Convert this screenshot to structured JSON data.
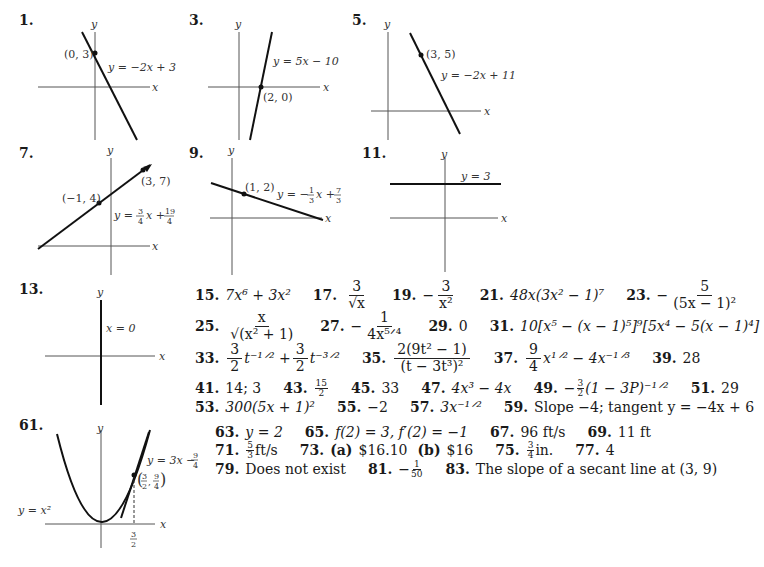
{
  "problems": {
    "p1": {
      "number": "1.",
      "equation": "y = −2x + 3",
      "point": "(0, 3)",
      "axis_x": "x",
      "axis_y": "y"
    },
    "p3": {
      "number": "3.",
      "equation": "y = 5x − 10",
      "point": "(2, 0)",
      "axis_x": "x",
      "axis_y": "y"
    },
    "p5": {
      "number": "5.",
      "equation": "y = −2x + 11",
      "point": "(3, 5)",
      "axis_x": "x",
      "axis_y": "y"
    },
    "p7": {
      "number": "7.",
      "equation_prefix": "y = ",
      "slope_num": "3",
      "slope_den": "4",
      "equation_mid": "x + ",
      "int_num": "19",
      "int_den": "4",
      "point_a": "(−1, 4)",
      "point_b": "(3, 7)",
      "axis_x": "x",
      "axis_y": "y"
    },
    "p9": {
      "number": "9.",
      "equation_prefix": "y = −",
      "slope_num": "1",
      "slope_den": "3",
      "equation_mid": "x + ",
      "int_num": "7",
      "int_den": "3",
      "point": "(1, 2)",
      "axis_x": "x",
      "axis_y": "y"
    },
    "p11": {
      "number": "11.",
      "equation": "y = 3",
      "axis_x": "x",
      "axis_y": "y"
    },
    "p13": {
      "number": "13.",
      "equation": "x = 0",
      "axis_x": "x",
      "axis_y": "y"
    },
    "p61": {
      "number": "61.",
      "curve": "y = x²",
      "tangent_prefix": "y = 3x − ",
      "tangent_num": "9",
      "tangent_den": "4",
      "point_x_num": "3",
      "point_x_den": "2",
      "point_y_num": "9",
      "point_y_den": "4",
      "tick_num": "3",
      "tick_den": "2",
      "axis_x": "x",
      "axis_y": "y"
    }
  },
  "answers": {
    "a15": {
      "n": "15.",
      "text": "7x⁶ + 3x²"
    },
    "a17": {
      "n": "17.",
      "num": "3",
      "den": "√x"
    },
    "a19": {
      "n": "19.",
      "sign": "−",
      "num": "3",
      "den": "x²"
    },
    "a21": {
      "n": "21.",
      "text": "48x(3x² − 1)⁷"
    },
    "a23": {
      "n": "23.",
      "sign": "−",
      "num": "5",
      "den": "(5x − 1)²"
    },
    "a25": {
      "n": "25.",
      "num": "x",
      "den": "√(x² + 1)"
    },
    "a27": {
      "n": "27.",
      "sign": "−",
      "num": "1",
      "den": "4x⁵ᐟ⁴"
    },
    "a29": {
      "n": "29.",
      "text": "0"
    },
    "a31": {
      "n": "31.",
      "text": "10[x⁵ − (x − 1)⁵]⁹[5x⁴ − 5(x − 1)⁴]"
    },
    "a33": {
      "n": "33.",
      "c1_num": "3",
      "c1_den": "2",
      "t1": "t⁻¹ᐟ² + ",
      "c2_num": "3",
      "c2_den": "2",
      "t2": "t⁻³ᐟ²"
    },
    "a35": {
      "n": "35.",
      "num": "2(9t² − 1)",
      "den": "(t − 3t³)²"
    },
    "a37": {
      "n": "37.",
      "c_num": "9",
      "c_den": "4",
      "text": "x¹ᐟ² − 4x⁻¹ᐟ³"
    },
    "a39": {
      "n": "39.",
      "text": "28"
    },
    "a41": {
      "n": "41.",
      "text": "14; 3"
    },
    "a43": {
      "n": "43.",
      "num": "15",
      "den": "2"
    },
    "a45": {
      "n": "45.",
      "text": "33"
    },
    "a47": {
      "n": "47.",
      "text": "4x³ − 4x"
    },
    "a49": {
      "n": "49.",
      "sign": "−",
      "num": "3",
      "den": "2",
      "text": "(1 − 3P)⁻¹ᐟ²"
    },
    "a51": {
      "n": "51.",
      "text": "29"
    },
    "a53": {
      "n": "53.",
      "text": "300(5x + 1)²"
    },
    "a55": {
      "n": "55.",
      "text": "−2"
    },
    "a57": {
      "n": "57.",
      "text": "3x⁻¹ᐟ²"
    },
    "a59": {
      "n": "59.",
      "text": "Slope −4; tangent y = −4x + 6"
    },
    "a63": {
      "n": "63.",
      "text": "y = 2"
    },
    "a65": {
      "n": "65.",
      "text": "f(2) = 3, f′(2) = −1"
    },
    "a67": {
      "n": "67.",
      "text": "96 ft/s"
    },
    "a69": {
      "n": "69.",
      "text": "11 ft"
    },
    "a71": {
      "n": "71.",
      "num": "5",
      "den": "3",
      "text": "ft/s"
    },
    "a73": {
      "n": "73.",
      "part_a": "(a)",
      "val_a": "$16.10",
      "part_b": "(b)",
      "val_b": "$16"
    },
    "a75": {
      "n": "75.",
      "num": "3",
      "den": "4",
      "text": "in."
    },
    "a77": {
      "n": "77.",
      "text": "4"
    },
    "a79": {
      "n": "79.",
      "text": "Does not exist"
    },
    "a81": {
      "n": "81.",
      "sign": "−",
      "num": "1",
      "den": "50"
    },
    "a83": {
      "n": "83.",
      "text": "The slope of a secant line at (3, 9)"
    }
  }
}
